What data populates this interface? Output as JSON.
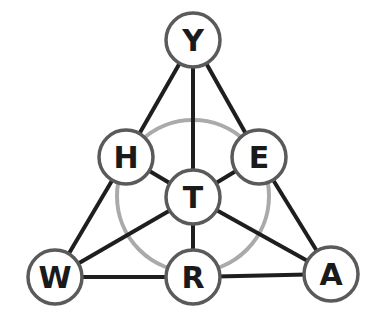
{
  "diagram": {
    "type": "letter-graph",
    "colors": {
      "background": "#ffffff",
      "edge": "#1e1e1e",
      "node_stroke": "#5a5a5a",
      "node_fill": "#ffffff",
      "guide_circle": "#aaaaaa",
      "label": "#1a1a1a"
    },
    "guide_circle": {
      "cx": 193,
      "cy": 196,
      "r": 76
    },
    "node_radius": 27,
    "nodes": [
      {
        "id": "Y",
        "label": "Y",
        "x": 193,
        "y": 40
      },
      {
        "id": "H",
        "label": "H",
        "x": 126,
        "y": 157
      },
      {
        "id": "E",
        "label": "E",
        "x": 259,
        "y": 157
      },
      {
        "id": "T",
        "label": "T",
        "x": 193,
        "y": 197
      },
      {
        "id": "W",
        "label": "W",
        "x": 55,
        "y": 277
      },
      {
        "id": "R",
        "label": "R",
        "x": 193,
        "y": 277
      },
      {
        "id": "A",
        "label": "A",
        "x": 331,
        "y": 274
      }
    ],
    "edges": [
      [
        "Y",
        "H"
      ],
      [
        "Y",
        "T"
      ],
      [
        "Y",
        "E"
      ],
      [
        "H",
        "W"
      ],
      [
        "E",
        "A"
      ],
      [
        "H",
        "T"
      ],
      [
        "E",
        "T"
      ],
      [
        "T",
        "W"
      ],
      [
        "T",
        "A"
      ],
      [
        "T",
        "R"
      ],
      [
        "W",
        "R"
      ],
      [
        "R",
        "A"
      ]
    ]
  }
}
